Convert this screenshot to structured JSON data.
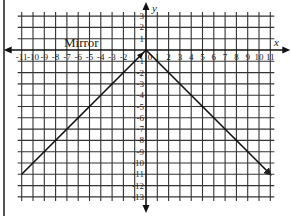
{
  "chart_data": {
    "type": "line",
    "title": "",
    "xlabel": "x",
    "ylabel": "y",
    "xlim": [
      -11,
      11
    ],
    "ylim": [
      -13,
      3
    ],
    "grid": true,
    "x_ticks": [
      -11,
      -10,
      -9,
      -8,
      -7,
      -6,
      -5,
      -4,
      -3,
      -2,
      0,
      1,
      2,
      3,
      4,
      5,
      6,
      7,
      8,
      9,
      10,
      11
    ],
    "x_tick_labels": [
      "-11",
      "-10",
      "-9",
      "-8",
      "-7",
      "-6",
      "-5",
      "-4",
      "-3",
      "-2",
      "0",
      "1",
      "2",
      "3",
      "4",
      "5",
      "6",
      "7",
      "8",
      "9",
      "10",
      "11"
    ],
    "y_tick_labels": [
      "3",
      "2",
      "1",
      "-1",
      "-2",
      "-3",
      "-4",
      "-5",
      "-6",
      "-7",
      "-8",
      "-9",
      "-10",
      "-11",
      "-12",
      "-13"
    ],
    "y_ticks": [
      3,
      2,
      1,
      -1,
      -2,
      -3,
      -4,
      -5,
      -6,
      -7,
      -8,
      -9,
      -10,
      -11,
      -12,
      -13
    ],
    "annotations": [
      {
        "text": "Mirror",
        "x": -8,
        "y": 0.5
      }
    ],
    "series": [
      {
        "name": "left ray",
        "points": [
          [
            0,
            0
          ],
          [
            -11,
            -11
          ]
        ],
        "arrow": "none"
      },
      {
        "name": "right ray",
        "points": [
          [
            0,
            0
          ],
          [
            11,
            -11
          ]
        ],
        "arrow": "end"
      }
    ]
  },
  "labels": {
    "x_axis": "x",
    "y_axis": "y",
    "mirror": "Mirror"
  }
}
